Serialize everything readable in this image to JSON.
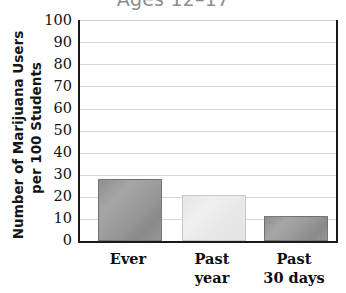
{
  "chart_data": {
    "type": "bar",
    "title": "Ages 12–17",
    "xlabel": "",
    "ylabel": "Number of Marijuana Users per 100 Students",
    "ylabel_lines": [
      "Number of Marijuana Users",
      "per 100 Students"
    ],
    "categories": [
      "Ever",
      "Past year",
      "Past 30 days"
    ],
    "category_lines": [
      [
        "Ever"
      ],
      [
        "Past",
        "year"
      ],
      [
        "Past",
        "30 days"
      ]
    ],
    "values": [
      28,
      21,
      11.5
    ],
    "ylim": [
      0,
      100
    ],
    "ytick_labels": [
      "100",
      "90",
      "80",
      "70",
      "60",
      "50",
      "40",
      "30",
      "20",
      "10",
      "0"
    ],
    "ytick_values": [
      100,
      90,
      80,
      70,
      60,
      50,
      40,
      30,
      20,
      10,
      0
    ],
    "grid": true,
    "legend": "none",
    "bar_colors": [
      "#9a9a9a",
      "#e8e8e8",
      "#9a9a9a"
    ],
    "axis_color": "#1a1a1a",
    "gridline_color": "#d8d8d8",
    "title_color": "#8d8d8d"
  }
}
